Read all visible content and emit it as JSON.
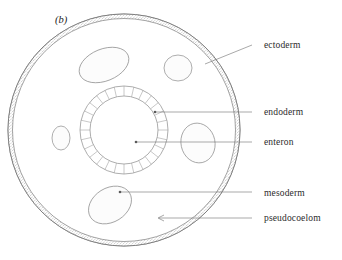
{
  "figure": {
    "panel_letter": "(b)",
    "diagram_type": "cross-section-pseudocoelomate-body-plan",
    "background_color": "#ffffff",
    "outline_color": "#6b6b6b",
    "body": {
      "center_x": 124,
      "center_y": 130,
      "outer_radius": 116,
      "ectoderm_band_thickness": 4.5,
      "ectoderm_texture": "stippled"
    },
    "enteron_ring": {
      "center_x": 124,
      "center_y": 130,
      "outer_radius": 44,
      "inner_radius": 34,
      "cell_count": 28,
      "cell_pattern": "radial-blocks"
    }
  },
  "labels": [
    {
      "id": "ectoderm",
      "text": "ectoderm",
      "text_x": 264,
      "text_y": 48,
      "leader_points": "205,64 252,45",
      "target_x": 205,
      "target_y": 64,
      "has_dot": false
    },
    {
      "id": "endoderm",
      "text": "endoderm",
      "text_x": 264,
      "text_y": 115,
      "leader_points": "155,112 252,112",
      "target_x": 155,
      "target_y": 112,
      "has_dot": true
    },
    {
      "id": "enteron",
      "text": "enteron",
      "text_x": 264,
      "text_y": 145,
      "leader_points": "136,142 252,142",
      "target_x": 136,
      "target_y": 142,
      "has_dot": true
    },
    {
      "id": "mesoderm",
      "text": "mesoderm",
      "text_x": 264,
      "text_y": 196,
      "leader_points": "120,192 252,192",
      "target_x": 120,
      "target_y": 192,
      "has_dot": true
    },
    {
      "id": "pseudocoelom",
      "text": "pseudocoelom",
      "text_x": 264,
      "text_y": 221,
      "leader_points": "159,218 252,218",
      "target_x": 159,
      "target_y": 218,
      "has_dot": false
    }
  ],
  "mesoderm_blobs": [
    {
      "id": "blob-top-left",
      "cx": 104,
      "cy": 65,
      "rx": 26,
      "ry": 16,
      "rotation": -22
    },
    {
      "id": "blob-top-right",
      "cx": 178,
      "cy": 68,
      "rx": 14,
      "ry": 13,
      "rotation": 0
    },
    {
      "id": "blob-left",
      "cx": 61,
      "cy": 138,
      "rx": 9,
      "ry": 12,
      "rotation": 0
    },
    {
      "id": "blob-right",
      "cx": 198,
      "cy": 143,
      "rx": 17,
      "ry": 20,
      "rotation": -12
    },
    {
      "id": "blob-bottom",
      "cx": 110,
      "cy": 205,
      "rx": 23,
      "ry": 17,
      "rotation": -32
    }
  ]
}
